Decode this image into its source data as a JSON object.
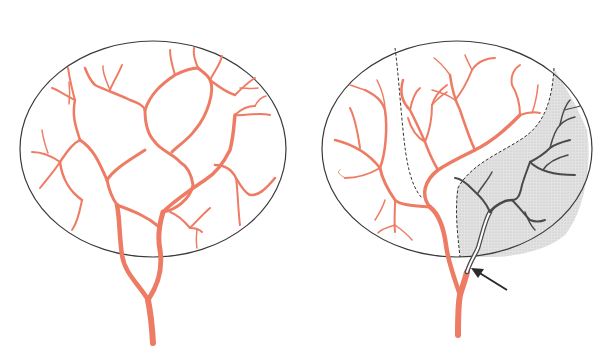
{
  "diagram": {
    "colors": {
      "background": "#ffffff",
      "outline": "#3a3a3a",
      "artery": "#ee7b63",
      "occluded_vessel": "#4a4a4a",
      "ischemic_region": "#dcdcdc",
      "arrow": "#2a2a2a"
    },
    "panels": [
      {
        "id": "left",
        "label": "",
        "state": "normal perfusion"
      },
      {
        "id": "right",
        "label": "",
        "state": "occluded branch with infarct territory"
      }
    ]
  }
}
